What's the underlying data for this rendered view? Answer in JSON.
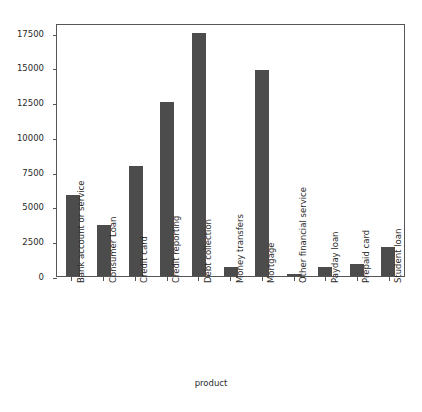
{
  "chart_data": {
    "type": "bar",
    "title": "",
    "xlabel": "product",
    "ylabel": "",
    "categories": [
      "Bank account or service",
      "Consumer Loan",
      "Credit card",
      "Credit reporting",
      "Debt collection",
      "Money transfers",
      "Mortgage",
      "Other financial service",
      "Payday loan",
      "Prepaid card",
      "Student loan"
    ],
    "values": [
      5800,
      3700,
      7900,
      12500,
      17500,
      650,
      14850,
      110,
      680,
      840,
      2100
    ],
    "ylim": [
      0,
      18200
    ],
    "yticks": [
      0,
      2500,
      5000,
      7500,
      10000,
      12500,
      15000,
      17500
    ],
    "ytick_labels": [
      "0",
      "2500",
      "5000",
      "7500",
      "10000",
      "12500",
      "15000",
      "17500"
    ],
    "grid": false,
    "legend": false,
    "bar_color": "#4c4c4c",
    "axis_color": "#555555",
    "background": "#ffffff"
  },
  "axes": {
    "x_title": "product"
  }
}
